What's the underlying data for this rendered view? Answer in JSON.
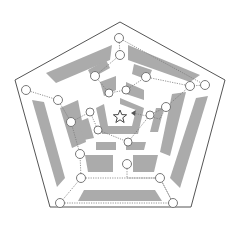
{
  "diagram": {
    "title": "",
    "type": "pentagonal-maze",
    "colors": {
      "background": "#ffffff",
      "frame_stroke": "#555555",
      "wall_fill": "#ababab",
      "path_stroke": "#7a7a7a",
      "node_stroke": "#6a6a6a"
    },
    "center": [
      120,
      117
    ],
    "goal_symbol": "star",
    "rings": [
      {
        "name": "outer",
        "nodes": [
          [
            119,
            38
          ],
          [
            205,
            85
          ],
          [
            173,
            203
          ],
          [
            60,
            203
          ],
          [
            26,
            90
          ]
        ]
      },
      {
        "name": "second",
        "nodes": [
          [
            120,
            55
          ],
          [
            190,
            86
          ],
          [
            160,
            178
          ],
          [
            81,
            178
          ],
          [
            58,
            100
          ]
        ]
      },
      {
        "name": "third",
        "nodes": [
          [
            95,
            76
          ],
          [
            146,
            77
          ],
          [
            166,
            107
          ],
          [
            127,
            164
          ],
          [
            80,
            154
          ],
          [
            71,
            122
          ]
        ]
      },
      {
        "name": "inner",
        "nodes": [
          [
            109,
            93
          ],
          [
            126,
            90
          ],
          [
            150,
            115
          ],
          [
            128,
            142
          ],
          [
            98,
            130
          ],
          [
            90,
            112
          ]
        ]
      }
    ],
    "entry_arrow": {
      "from": [
        160,
        119
      ],
      "to": [
        131,
        113
      ]
    }
  }
}
